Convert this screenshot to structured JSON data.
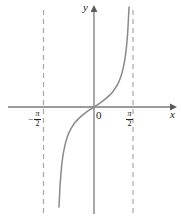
{
  "figure": {
    "axis_labels": {
      "x": "x",
      "y": "y",
      "origin": "0"
    },
    "ticks": {
      "left": {
        "sign": "−",
        "numerator": "π",
        "denominator": "2"
      },
      "right": {
        "sign": "",
        "numerator": "π",
        "denominator": "2"
      }
    },
    "colors": {
      "curve": "#8a8a8a",
      "axis": "#7a7a7a",
      "asymptote": "#a8a8a8",
      "text": "#222222",
      "background": "#ffffff"
    }
  },
  "chart_data": {
    "type": "line",
    "title": "",
    "xlabel": "x",
    "ylabel": "y",
    "function": "y = tan x",
    "xlim": [
      -2.35,
      2.35
    ],
    "ylim": [
      -6.2,
      6.2
    ],
    "grid": false,
    "legend": null,
    "xticks": [
      -1.5708,
      0,
      1.5708
    ],
    "xticklabels": [
      "−π/2",
      "0",
      "π/2"
    ],
    "yticks": [],
    "yticklabels": [],
    "asymptotes": [
      {
        "type": "vertical",
        "x": -1.5708,
        "style": "dashed",
        "label": "−π/2"
      },
      {
        "type": "vertical",
        "x": 1.5708,
        "style": "dashed",
        "label": "π/2"
      }
    ],
    "series": [
      {
        "name": "y = tan x",
        "style": "solid",
        "x": [
          -1.41,
          -1.36,
          -1.3,
          -1.24,
          -1.16,
          -1.08,
          -0.98,
          -0.87,
          -0.75,
          -0.61,
          -0.46,
          -0.31,
          -0.15,
          0.0,
          0.15,
          0.31,
          0.46,
          0.61,
          0.75,
          0.87,
          0.98,
          1.08,
          1.16,
          1.24,
          1.3,
          1.36,
          1.41
        ],
        "y": [
          -6.17,
          -4.67,
          -3.6,
          -2.91,
          -2.3,
          -1.87,
          -1.49,
          -1.19,
          -0.93,
          -0.7,
          -0.5,
          -0.32,
          -0.15,
          0.0,
          0.15,
          0.32,
          0.5,
          0.7,
          0.93,
          1.19,
          1.49,
          1.87,
          2.3,
          2.91,
          3.6,
          4.67,
          6.17
        ]
      }
    ]
  }
}
